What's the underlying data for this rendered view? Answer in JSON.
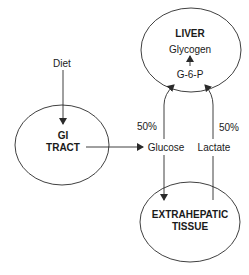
{
  "nodes": {
    "liver": {
      "title": "LIVER",
      "glycogen": "Glycogen",
      "g6p": "G-6-P"
    },
    "gi_tract": {
      "line1": "GI",
      "line2": "TRACT"
    },
    "extrahepatic": {
      "line1": "EXTRAHEPATIC",
      "line2": "TISSUE"
    }
  },
  "labels": {
    "diet": "Diet",
    "glucose": "Glucose",
    "lactate": "Lactate",
    "glucose_pct": "50%",
    "lactate_pct": "50%"
  },
  "colors": {
    "stroke": "#2a2a2a",
    "text": "#1a1a1a",
    "background": "#ffffff"
  }
}
